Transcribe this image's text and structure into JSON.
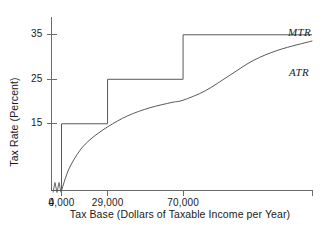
{
  "chart_data": {
    "type": "line",
    "title": "",
    "xlabel": "Tax Base (Dollars of Taxable Income per Year)",
    "ylabel": "Tax Rate (Percent)",
    "xlim": [
      0,
      140000
    ],
    "ylim": [
      0,
      39
    ],
    "grid": false,
    "legend_position": "inline-right",
    "x_ticks": [
      {
        "value": 0,
        "label": "0"
      },
      {
        "value": 4000,
        "label": "4,000"
      },
      {
        "value": 29000,
        "label": "29,000"
      },
      {
        "value": 70000,
        "label": "70,000"
      }
    ],
    "y_ticks": [
      {
        "value": 15,
        "label": "15"
      },
      {
        "value": 25,
        "label": "25"
      },
      {
        "value": 35,
        "label": "35"
      }
    ],
    "axis_break": {
      "present": true,
      "between": [
        0,
        4000
      ],
      "style": "zigzag"
    },
    "series": [
      {
        "name": "MTR",
        "label": "MTR",
        "type": "step",
        "color": "#595959",
        "brackets": [
          {
            "x_start": 0,
            "x_end": 4000,
            "rate": 0
          },
          {
            "x_start": 4000,
            "x_end": 29000,
            "rate": 15
          },
          {
            "x_start": 29000,
            "x_end": 70000,
            "rate": 25
          },
          {
            "x_start": 70000,
            "x_end": 140000,
            "rate": 35
          }
        ]
      },
      {
        "name": "ATR",
        "label": "ATR",
        "type": "curve",
        "color": "#595959",
        "points": [
          {
            "x": 4000,
            "y": 0
          },
          {
            "x": 8000,
            "y": 4.8
          },
          {
            "x": 14000,
            "y": 9.0
          },
          {
            "x": 20000,
            "y": 11.6
          },
          {
            "x": 29000,
            "y": 14.3
          },
          {
            "x": 40000,
            "y": 16.8
          },
          {
            "x": 52000,
            "y": 18.6
          },
          {
            "x": 64000,
            "y": 19.8
          },
          {
            "x": 70000,
            "y": 20.3
          },
          {
            "x": 82000,
            "y": 22.4
          },
          {
            "x": 95000,
            "y": 25.8
          },
          {
            "x": 108000,
            "y": 29.2
          },
          {
            "x": 122000,
            "y": 31.6
          },
          {
            "x": 140000,
            "y": 33.6
          }
        ]
      }
    ]
  },
  "annotations": {
    "mtr_label": "MTR",
    "atr_label": "ATR"
  },
  "colors": {
    "line": "#595959",
    "axis": "#6b6b6b",
    "text": "#1a1a1a",
    "background": "#ffffff"
  }
}
